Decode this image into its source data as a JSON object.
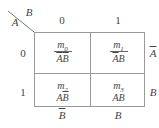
{
  "diagram": {
    "type": "karnaugh-map",
    "corner": {
      "row_var": "A",
      "col_var": "B"
    },
    "col_headers": [
      "0",
      "1"
    ],
    "row_headers": [
      "0",
      "1"
    ],
    "cells": [
      {
        "minterm": "m",
        "index": "0",
        "term_a": "A",
        "term_b": "B",
        "a_bar": true,
        "b_bar": true
      },
      {
        "minterm": "m",
        "index": "1",
        "term_a": "A",
        "term_b": "B",
        "a_bar": true,
        "b_bar": false
      },
      {
        "minterm": "m",
        "index": "2",
        "term_a": "A",
        "term_b": "B",
        "a_bar": false,
        "b_bar": true
      },
      {
        "minterm": "m",
        "index": "3",
        "term_a": "A",
        "term_b": "B",
        "a_bar": false,
        "b_bar": false
      }
    ],
    "right_labels": [
      {
        "text": "A",
        "overline": true
      },
      {
        "text": "B",
        "overline": false
      }
    ],
    "bottom_labels": [
      {
        "text": "B",
        "overline": true
      },
      {
        "text": "B",
        "overline": false
      }
    ]
  }
}
